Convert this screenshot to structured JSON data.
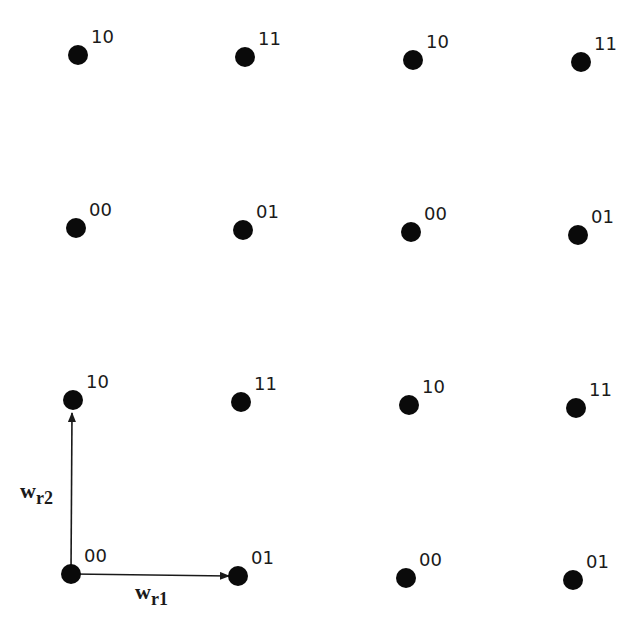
{
  "diagram": {
    "type": "lattice",
    "dot_color": "#0a0a0a",
    "points": [
      {
        "x": 78,
        "y": 55,
        "label": "10"
      },
      {
        "x": 245,
        "y": 57,
        "label": "11"
      },
      {
        "x": 413,
        "y": 60,
        "label": "10"
      },
      {
        "x": 581,
        "y": 62,
        "label": "11"
      },
      {
        "x": 76,
        "y": 228,
        "label": "00"
      },
      {
        "x": 243,
        "y": 230,
        "label": "01"
      },
      {
        "x": 411,
        "y": 232,
        "label": "00"
      },
      {
        "x": 578,
        "y": 235,
        "label": "01"
      },
      {
        "x": 73,
        "y": 400,
        "label": "10"
      },
      {
        "x": 241,
        "y": 402,
        "label": "11"
      },
      {
        "x": 409,
        "y": 405,
        "label": "10"
      },
      {
        "x": 576,
        "y": 408,
        "label": "11"
      },
      {
        "x": 71,
        "y": 574,
        "label": "00"
      },
      {
        "x": 238,
        "y": 576,
        "label": "01"
      },
      {
        "x": 406,
        "y": 578,
        "label": "00"
      },
      {
        "x": 573,
        "y": 580,
        "label": "01"
      }
    ],
    "vectors": {
      "wr1": {
        "base": "w",
        "sub": "r1"
      },
      "wr2": {
        "base": "w",
        "sub": "r2"
      }
    }
  }
}
